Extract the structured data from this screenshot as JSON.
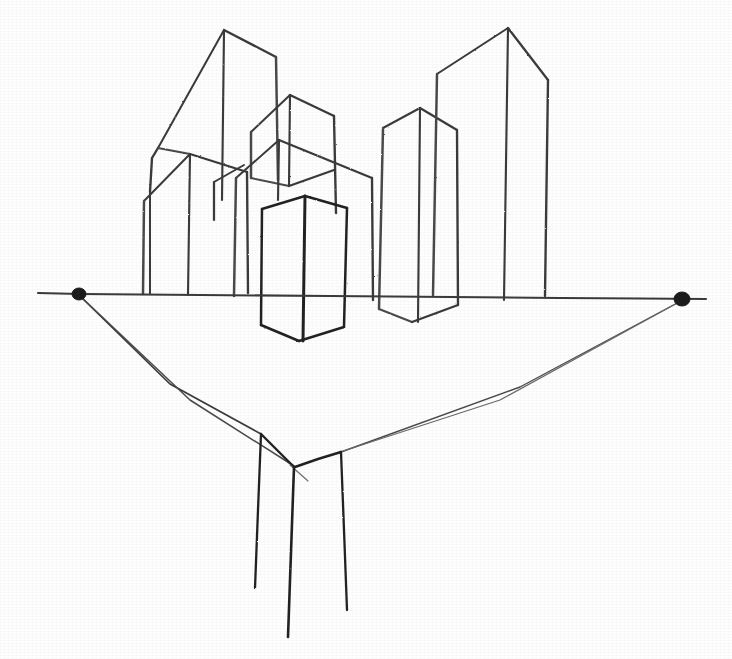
{
  "artwork": {
    "title": "Two-Point Perspective City Block Study",
    "medium": "graphite pencil on paper",
    "subject": "cityscape perspective construction",
    "canvas": {
      "width": 732,
      "height": 659
    },
    "colors": {
      "paper": "#fefefe",
      "graphite": "#333333",
      "graphite_dark": "#232323",
      "graphite_soft": "#4a4a4a",
      "graphite_faint": "#6a6a6a",
      "vanishing_point_dot": "#1c1c1c"
    }
  },
  "horizon": {
    "name": "horizon-line",
    "y_left": 294,
    "y_right": 299,
    "x_start": 38,
    "x_end": 706,
    "path": "M38,293 L80,294 L200,295 L330,296 L450,297 L560,298 L640,298.5 L706,299"
  },
  "vanishing_points": [
    {
      "label": "left-vanishing-point",
      "x": 79,
      "y": 294,
      "rx": 7,
      "ry": 6
    },
    {
      "label": "right-vanishing-point",
      "x": 682,
      "y": 299,
      "rx": 8,
      "ry": 7
    }
  ],
  "convergence_lines": [
    {
      "label": "left-vp-to-near-corner",
      "path": "M80,296 L170,384 L261,434"
    },
    {
      "label": "left-vp-to-bottom-vertex",
      "path": "M80,296 L190,400 L294,466"
    },
    {
      "label": "right-vp-to-near-corner",
      "path": "M681,301 L520,387 L341,452"
    },
    {
      "label": "right-vp-to-bottom-vertex",
      "path": "M681,301 L500,400 L294,467"
    },
    {
      "label": "near-corner-left-edge",
      "path": "M261,434 L278,451 L294,467"
    },
    {
      "label": "near-corner-right-edge",
      "path": "M341,452 L318,459 L295,467"
    },
    {
      "label": "stray-guide-tick",
      "path": "M290,465 L308,481"
    }
  ],
  "foreground_verticals": [
    {
      "label": "foreground-vertical-left",
      "path": "M261,434 L258,510 L255,588"
    },
    {
      "label": "foreground-vertical-center",
      "path": "M294,467 L291,552 L288,637"
    },
    {
      "label": "foreground-vertical-right",
      "path": "M341,452 L344,530 L347,610"
    }
  ],
  "buildings": [
    {
      "name": "building-tall-left",
      "description": "tallest building at the left of the cluster, sloped roof ridge",
      "strokes": [
        "M224,30 L158,148",
        "M224,30 L276,57",
        "M276,57 L278,180",
        "M224,30 L222,200",
        "M158,148 L152,158 L150,192",
        "M158,148 L190,154"
      ]
    },
    {
      "name": "building-left-front",
      "description": "mid-height building in front-left with gabled cap, base on horizon",
      "strokes": [
        "M190,154 L144,201",
        "M190,154 L247,172",
        "M144,201 L143,294",
        "M190,154 L188,295",
        "M247,172 L248,293"
      ]
    },
    {
      "name": "building-left-short",
      "description": "short slab left of cluster ending at horizon",
      "strokes": [
        "M150,192 L150,294"
      ]
    },
    {
      "name": "building-mid-upper",
      "description": "upper middle building with pointed cap behind the center",
      "strokes": [
        "M290,95 L251,132",
        "M290,95 L334,116",
        "M251,132 L251,178",
        "M290,95 L289,186",
        "M334,116 L336,213",
        "M251,178 L289,186",
        "M289,186 L334,170"
      ]
    },
    {
      "name": "building-mid-lower",
      "description": "middle building whose ridge overlaps the upper one",
      "strokes": [
        "M279,140 L236,178",
        "M279,140 L372,178",
        "M236,178 L234,296",
        "M279,140 L278,200",
        "M372,178 L373,300"
      ]
    },
    {
      "name": "building-mid-small",
      "description": "small box tucked between middle buildings",
      "strokes": [
        "M244,165 L214,182",
        "M214,182 L214,220"
      ]
    },
    {
      "name": "building-center-front",
      "description": "dark foreground box crossing the horizon, drawn with heaviest line",
      "strokes": [
        "M305,196 L262,209",
        "M305,196 L347,208",
        "M262,209 L261,325",
        "M305,196 L303,341",
        "M347,208 L344,327",
        "M261,325 L299,341",
        "M299,341 L344,327"
      ]
    },
    {
      "name": "building-right-near",
      "description": "nearer right tower crossing the horizon with visible base",
      "strokes": [
        "M420,108 L383,128",
        "M420,108 L457,130",
        "M383,128 L379,309",
        "M420,108 L418,322",
        "M457,130 L458,305",
        "M379,309 L412,322",
        "M412,322 L458,305"
      ]
    },
    {
      "name": "building-right-tall",
      "description": "tallest tower on the right with a high sloped apex",
      "strokes": [
        "M508,28 L437,74",
        "M508,28 L548,80",
        "M437,74 L433,295",
        "M508,28 L504,300",
        "M548,80 L545,296"
      ]
    },
    {
      "name": "building-right-back-slab",
      "description": "narrow slab behind right near tower ending at horizon",
      "strokes": [
        "M373,300 L373,178"
      ]
    }
  ],
  "annotations": {
    "horizon_label": "horizon line",
    "left_vp_label": "VP left",
    "right_vp_label": "VP right"
  }
}
